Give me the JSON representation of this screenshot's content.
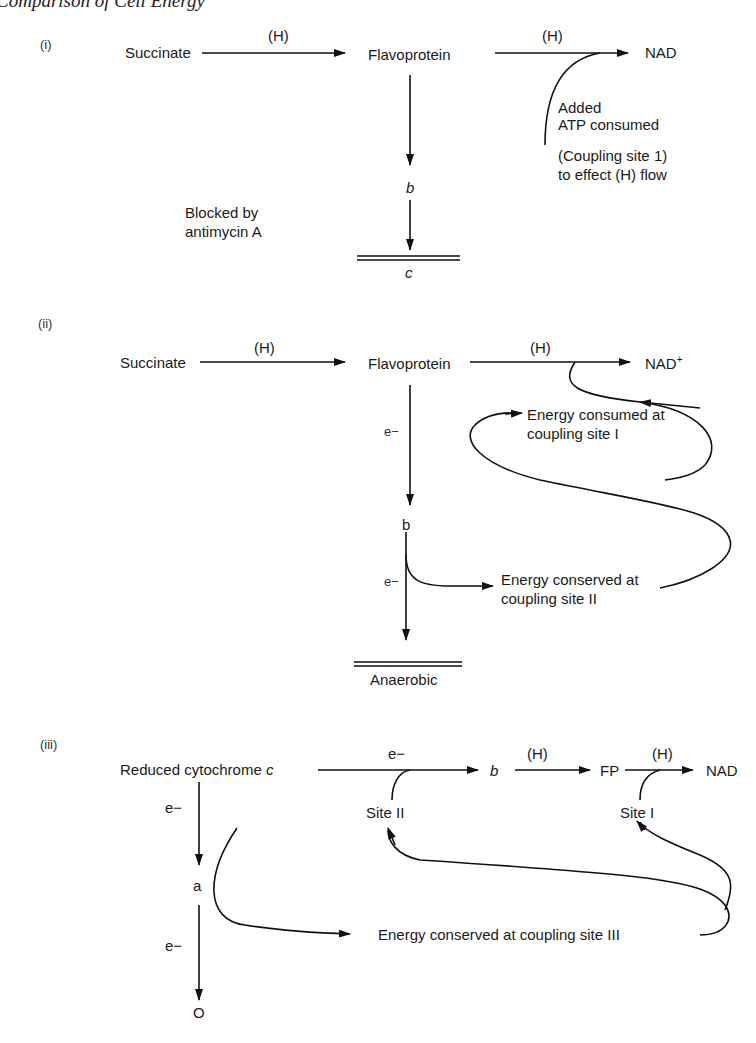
{
  "header": {
    "running_title": "Comparison of Cell Energy"
  },
  "panel_i": {
    "label": "(i)",
    "succinate": "Succinate",
    "h1": "(H)",
    "flavoprotein": "Flavoprotein",
    "h2": "(H)",
    "nad": "NAD",
    "added": "Added",
    "atp_consumed": "ATP consumed",
    "coupling_site": "(Coupling site 1)",
    "effect_flow": "to effect (H) flow",
    "b": "b",
    "blocked_1": "Blocked by",
    "blocked_2": "antimycin A",
    "c": "c"
  },
  "panel_ii": {
    "label": "(ii)",
    "succinate": "Succinate",
    "h1": "(H)",
    "flavoprotein": "Flavoprotein",
    "h2": "(H)",
    "nad": "NAD",
    "nad_sup": "+",
    "e1": "e−",
    "consumed_1": "Energy consumed at",
    "consumed_2": "coupling site I",
    "b": "b",
    "e2": "e−",
    "conserved_1": "Energy conserved at",
    "conserved_2": "coupling site II",
    "anaerobic": "Anaerobic"
  },
  "panel_iii": {
    "label": "(iii)",
    "reduced_cyt": "Reduced cytochrome ",
    "c": "c",
    "e_top": "e−",
    "b": "b",
    "h1": "(H)",
    "fp": "FP",
    "h2": "(H)",
    "nad": "NAD",
    "site_ii": "Site II",
    "site_i": "Site I",
    "e_left1": "e−",
    "a": "a",
    "e_left2": "e−",
    "o": "O",
    "conserved_iii": "Energy conserved at coupling site III"
  }
}
